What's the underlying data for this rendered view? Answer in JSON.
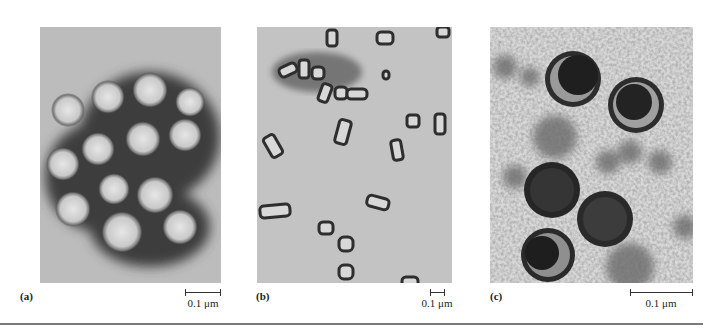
{
  "figure": {
    "panels": [
      {
        "id": "a",
        "label": "(a)",
        "description": "Electron micrograph of enveloped, roughly spherical virus particles with spiky surface, negatively stained",
        "scale_bar": {
          "value": "0.1 μm",
          "length_px": 36
        }
      },
      {
        "id": "b",
        "label": "(b)",
        "description": "Electron micrograph of bullet/rod-shaped virus particles, negatively stained",
        "scale_bar": {
          "value": "0.1 μm",
          "length_px": 15
        }
      },
      {
        "id": "c",
        "label": "(c)",
        "description": "Thin-section electron micrograph of enveloped virus particles with dense cores",
        "scale_bar": {
          "value": "0.1 μm",
          "length_px": 63
        }
      }
    ]
  }
}
